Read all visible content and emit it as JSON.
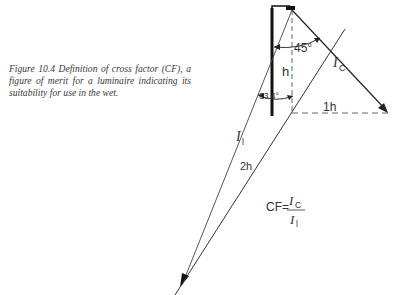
{
  "caption": {
    "figure_label": "Figure 10.4",
    "text": "Figure 10.4 Definition of cross factor (CF), a figure of merit for a luminaire indicating its suitability for use in the wet."
  },
  "diagram": {
    "labels": {
      "angle_45": "45°",
      "angle_634": "63.4°",
      "height": "h",
      "horizontal": "1h",
      "long": "2h",
      "ic_main": "I",
      "ic_sub": "C",
      "il_main": "I",
      "il_sub": "l"
    },
    "formula": {
      "lhs": "CF=",
      "num_main": "I",
      "num_sub": "C",
      "den_main": "I",
      "den_sub": "l"
    }
  }
}
